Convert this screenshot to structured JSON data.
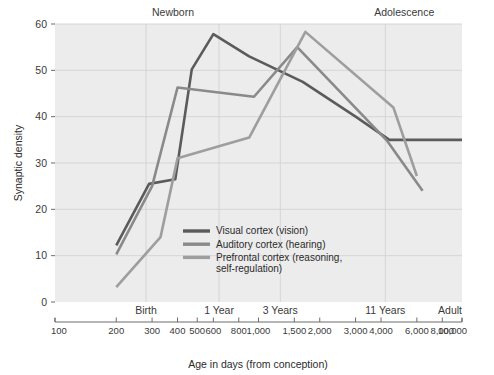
{
  "chart_data": {
    "type": "line",
    "title": "",
    "xlabel": "Age in days (from conception)",
    "ylabel": "Synaptic density",
    "xscale": "log",
    "xlim": [
      100,
      10000
    ],
    "ylim": [
      0,
      60
    ],
    "grid": true,
    "legend_position": "inside-center-bottom",
    "x_tick_labels": [
      "100",
      "200",
      "300",
      "400",
      "500",
      "600",
      "800",
      "1,000",
      "1,500",
      "2,000",
      "3,000",
      "4,000",
      "6,000",
      "8,000",
      "10,000"
    ],
    "x_tick_values": [
      100,
      200,
      300,
      400,
      500,
      600,
      800,
      1000,
      1500,
      2000,
      3000,
      4000,
      6000,
      8000,
      10000
    ],
    "y_tick_labels": [
      "0",
      "10",
      "20",
      "30",
      "40",
      "50",
      "60"
    ],
    "y_tick_values": [
      0,
      10,
      20,
      30,
      40,
      50,
      60
    ],
    "stage_labels": [
      {
        "label": "Birth",
        "x": 280
      },
      {
        "label": "1 Year",
        "x": 640
      },
      {
        "label": "3 Years",
        "x": 1280
      },
      {
        "label": "11 Years",
        "x": 4200
      },
      {
        "label": "Adult",
        "x": 10000
      }
    ],
    "era_labels": [
      {
        "label": "Newborn",
        "x": 380
      },
      {
        "label": "Adolescence",
        "x": 5200
      }
    ],
    "series": [
      {
        "name": "Visual cortex (vision)",
        "color": "#5b5b5b",
        "points": [
          {
            "x": 200,
            "y": 12.2
          },
          {
            "x": 290,
            "y": 25.5
          },
          {
            "x": 390,
            "y": 26.5
          },
          {
            "x": 470,
            "y": 50.2
          },
          {
            "x": 600,
            "y": 57.8
          },
          {
            "x": 900,
            "y": 53.0
          },
          {
            "x": 1650,
            "y": 47.5
          },
          {
            "x": 3000,
            "y": 40.0
          },
          {
            "x": 4400,
            "y": 35.0
          },
          {
            "x": 10000,
            "y": 35.0
          }
        ]
      },
      {
        "name": "Auditory cortex (hearing)",
        "color": "#8a8a8a",
        "points": [
          {
            "x": 200,
            "y": 10.3
          },
          {
            "x": 300,
            "y": 25.0
          },
          {
            "x": 400,
            "y": 46.3
          },
          {
            "x": 700,
            "y": 45.0
          },
          {
            "x": 950,
            "y": 44.3
          },
          {
            "x": 1550,
            "y": 55.0
          },
          {
            "x": 4300,
            "y": 34.7
          },
          {
            "x": 6400,
            "y": 24.0
          }
        ]
      },
      {
        "name": "Prefrontal cortex (reasoning, self-regulation)",
        "color": "#9e9e9e",
        "points": [
          {
            "x": 200,
            "y": 3.2
          },
          {
            "x": 330,
            "y": 14.0
          },
          {
            "x": 400,
            "y": 31.0
          },
          {
            "x": 900,
            "y": 35.5
          },
          {
            "x": 1700,
            "y": 58.3
          },
          {
            "x": 4600,
            "y": 42.0
          },
          {
            "x": 6000,
            "y": 27.2
          }
        ]
      }
    ]
  },
  "legend": {
    "entries": [
      "Visual cortex (vision)",
      "Auditory cortex (hearing)",
      "Prefrontal cortex (reasoning,",
      "self-regulation)"
    ]
  }
}
